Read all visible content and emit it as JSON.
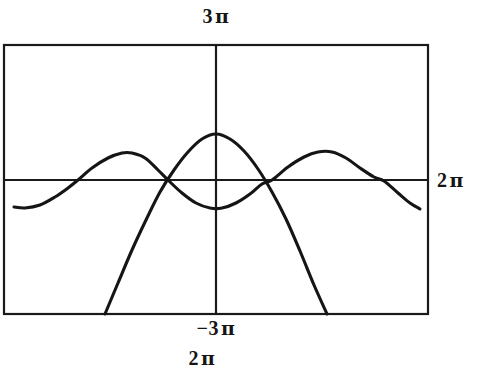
{
  "figure": {
    "background_color": "#ffffff",
    "ink_color": "#151515",
    "frame": {
      "x0": 4,
      "y0": 45,
      "x1": 428,
      "y1": 314
    },
    "axes": {
      "x_axis_y": 180,
      "y_axis_x": 216
    }
  },
  "labels": {
    "top": "3 π",
    "top_value": "3",
    "top_unit": "π",
    "right": "2 π",
    "right_value": "2",
    "right_unit": "π",
    "bottom_ymin": "−3 π",
    "bottom_ymin_value": "−3",
    "bottom_ymin_unit": "π",
    "bottom_xmax": "2 π",
    "bottom_xmax_value": "2",
    "bottom_xmax_unit": "π"
  },
  "chart_data": {
    "type": "line",
    "title": "",
    "xlabel": "",
    "ylabel": "",
    "grid": false,
    "legend": "none",
    "xlim": [
      -6.283185,
      6.283185
    ],
    "ylim": [
      -9.424778,
      9.424778
    ],
    "xlim_labels": [
      "",
      "2 π"
    ],
    "ylim_labels": [
      "−3 π",
      "3 π"
    ],
    "axis_tick_labels": {
      "y_max": "3 π",
      "y_min": "−3 π",
      "x_max": "2 π",
      "x_right_side": "2 π"
    },
    "series": [
      {
        "name": "sine-curve",
        "kind": "sinusoid",
        "points": [
          [
            14,
            207
          ],
          [
            25,
            208
          ],
          [
            40,
            205
          ],
          [
            55,
            197
          ],
          [
            68,
            188
          ],
          [
            78,
            180
          ],
          [
            92,
            168
          ],
          [
            108,
            158
          ],
          [
            122,
            153
          ],
          [
            132,
            153
          ],
          [
            145,
            158
          ],
          [
            158,
            170
          ],
          [
            168,
            180
          ],
          [
            182,
            193
          ],
          [
            196,
            203
          ],
          [
            210,
            208
          ],
          [
            222,
            208
          ],
          [
            236,
            203
          ],
          [
            250,
            194
          ],
          [
            262,
            184
          ],
          [
            272,
            180
          ],
          [
            288,
            167
          ],
          [
            304,
            157
          ],
          [
            318,
            152
          ],
          [
            332,
            152
          ],
          [
            346,
            158
          ],
          [
            360,
            168
          ],
          [
            374,
            177
          ],
          [
            384,
            181
          ],
          [
            398,
            193
          ],
          [
            410,
            203
          ],
          [
            420,
            209
          ]
        ]
      },
      {
        "name": "parabola-curve",
        "kind": "downward-parabola",
        "vertex": [
          216,
          134
        ],
        "points": [
          [
            105,
            314
          ],
          [
            118,
            283
          ],
          [
            132,
            250
          ],
          [
            146,
            220
          ],
          [
            160,
            192
          ],
          [
            174,
            170
          ],
          [
            188,
            152
          ],
          [
            202,
            139
          ],
          [
            216,
            134
          ],
          [
            230,
            139
          ],
          [
            244,
            151
          ],
          [
            258,
            169
          ],
          [
            272,
            192
          ],
          [
            286,
            219
          ],
          [
            300,
            251
          ],
          [
            314,
            285
          ],
          [
            327,
            314
          ]
        ]
      }
    ]
  }
}
